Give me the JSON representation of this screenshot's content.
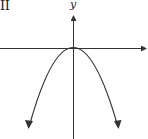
{
  "diagram": {
    "panel_label": "II",
    "y_axis_label": "y",
    "x_axis_label": "",
    "curve": {
      "type": "parabola",
      "opens": "down",
      "vertex": "origin",
      "equation_shape": "y = -a x^2",
      "end_arrows": true
    },
    "axes": {
      "x_arrow": "right",
      "y_arrow": "up"
    },
    "colors": {
      "stroke": "#333333",
      "background": "#ffffff"
    }
  }
}
